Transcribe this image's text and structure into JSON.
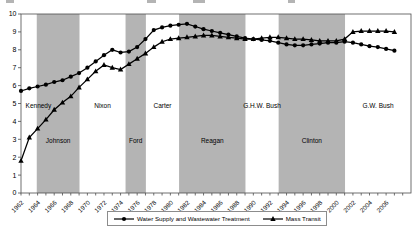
{
  "chart_data": {
    "type": "line",
    "title_note": "",
    "x_domain": [
      1962,
      2009
    ],
    "x": [
      1962,
      1963,
      1964,
      1965,
      1966,
      1967,
      1968,
      1969,
      1970,
      1971,
      1972,
      1973,
      1974,
      1975,
      1976,
      1977,
      1978,
      1979,
      1980,
      1981,
      1982,
      1983,
      1984,
      1985,
      1986,
      1987,
      1988,
      1989,
      1990,
      1991,
      1992,
      1993,
      1994,
      1995,
      1996,
      1997,
      1998,
      1999,
      2000,
      2001,
      2002,
      2003,
      2004,
      2005,
      2006,
      2007
    ],
    "x_tick_labels": [
      1962,
      1964,
      1966,
      1968,
      1970,
      1972,
      1974,
      1976,
      1978,
      1980,
      1982,
      1984,
      1986,
      1988,
      1990,
      1992,
      1994,
      1996,
      1998,
      2000,
      2002,
      2004,
      2006
    ],
    "minor_ticks": {
      "from": 1962,
      "to": 2008,
      "step": 1
    },
    "y_axis": {
      "min": 0,
      "max": 10,
      "step": 1
    },
    "grid": false,
    "colors": {
      "band_gray": "#b4b4b4",
      "series_line": "#000000",
      "axis": "#4d4d4d"
    },
    "series": [
      {
        "name": "Water Supply and Wastewater Treatment",
        "marker": "circle",
        "values": [
          5.7,
          5.85,
          5.95,
          6.05,
          6.2,
          6.3,
          6.5,
          6.7,
          7.0,
          7.35,
          7.7,
          8.0,
          7.85,
          7.9,
          8.15,
          8.6,
          9.1,
          9.25,
          9.35,
          9.4,
          9.45,
          9.3,
          9.15,
          9.05,
          8.95,
          8.85,
          8.75,
          8.65,
          8.6,
          8.55,
          8.5,
          8.4,
          8.3,
          8.25,
          8.25,
          8.3,
          8.35,
          8.4,
          8.4,
          8.45,
          8.4,
          8.3,
          8.2,
          8.15,
          8.05,
          7.95
        ]
      },
      {
        "name": "Mass Transit",
        "marker": "triangle",
        "values": [
          1.8,
          3.1,
          3.6,
          4.1,
          4.65,
          5.05,
          5.4,
          5.9,
          6.35,
          6.8,
          7.15,
          7.0,
          6.9,
          7.2,
          7.5,
          7.8,
          8.15,
          8.45,
          8.6,
          8.65,
          8.7,
          8.75,
          8.8,
          8.8,
          8.75,
          8.7,
          8.65,
          8.6,
          8.6,
          8.65,
          8.7,
          8.7,
          8.65,
          8.6,
          8.6,
          8.55,
          8.5,
          8.5,
          8.5,
          8.6,
          9.0,
          9.05,
          9.05,
          9.05,
          9.05,
          9.0
        ]
      }
    ],
    "presidents": [
      {
        "name": "Kennedy",
        "start": 1962,
        "end": 1963.9,
        "shaded": false,
        "label_row": "upper",
        "label_year": 1964.1
      },
      {
        "name": "Johnson",
        "start": 1963.9,
        "end": 1969.05,
        "shaded": true,
        "label_row": "lower"
      },
      {
        "name": "Nixon",
        "start": 1969.05,
        "end": 1974.6,
        "shaded": false,
        "label_row": "upper"
      },
      {
        "name": "Ford",
        "start": 1974.6,
        "end": 1977.05,
        "shaded": true,
        "label_row": "lower"
      },
      {
        "name": "Carter",
        "start": 1977.05,
        "end": 1981.05,
        "shaded": false,
        "label_row": "upper"
      },
      {
        "name": "Reagan",
        "start": 1981.05,
        "end": 1989.05,
        "shaded": true,
        "label_row": "lower"
      },
      {
        "name": "G.H.W. Bush",
        "start": 1989.05,
        "end": 1993.05,
        "shaded": false,
        "label_row": "upper"
      },
      {
        "name": "Clinton",
        "start": 1993.05,
        "end": 2001.05,
        "shaded": true,
        "label_row": "lower"
      },
      {
        "name": "G.W. Bush",
        "start": 2001.05,
        "end": 2009,
        "shaded": false,
        "label_row": "upper"
      }
    ],
    "legend_position": "bottom-center"
  }
}
